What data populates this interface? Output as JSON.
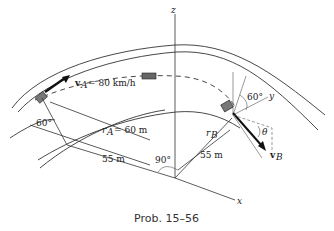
{
  "figure": {
    "caption": "Prob. 15–56",
    "labels": {
      "velocity_a": "v",
      "velocity_a_sub": "A",
      "velocity_a_value": "= 80 km/h",
      "radius_a": "r",
      "radius_a_sub": "A",
      "radius_a_value": "= 60 m",
      "angle_a": "60°",
      "dist_a": "55 m",
      "angle_right": "90°",
      "radius_b": "r",
      "radius_b_sub": "B",
      "dist_b": "55 m",
      "angle_b": "60°",
      "theta": "θ",
      "velocity_b": "v",
      "velocity_b_sub": "B",
      "axis_z": "z",
      "axis_y": "y",
      "axis_x": "x"
    }
  }
}
